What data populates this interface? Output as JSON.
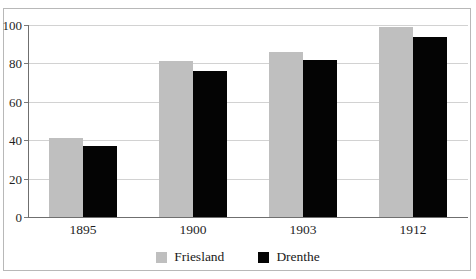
{
  "chart_data": {
    "type": "bar",
    "title": "",
    "xlabel": "",
    "ylabel": "",
    "categories": [
      "1895",
      "1900",
      "1903",
      "1912"
    ],
    "series": [
      {
        "name": "Friesland",
        "color": "#bfbfbf",
        "values": [
          41,
          81,
          86,
          99
        ]
      },
      {
        "name": "Drenthe",
        "color": "#040404",
        "values": [
          37,
          76,
          82,
          94
        ]
      }
    ],
    "ylim": [
      0,
      100
    ],
    "yticks": [
      0,
      20,
      40,
      60,
      80,
      100
    ],
    "ytick_labels": [
      "0",
      "20",
      "40",
      "60",
      "80",
      "100"
    ],
    "grid": true,
    "legend_position": "bottom-center"
  },
  "legend": {
    "items": [
      {
        "label": "Friesland",
        "color": "#bfbfbf"
      },
      {
        "label": "Drenthe",
        "color": "#040404"
      }
    ]
  },
  "colors": {
    "friesland": "#bfbfbf",
    "drenthe": "#040404",
    "axis": "#6f6f6f",
    "gridline": "#d2d2d2",
    "frame": "#b8b8b8",
    "background": "#ffffff"
  }
}
